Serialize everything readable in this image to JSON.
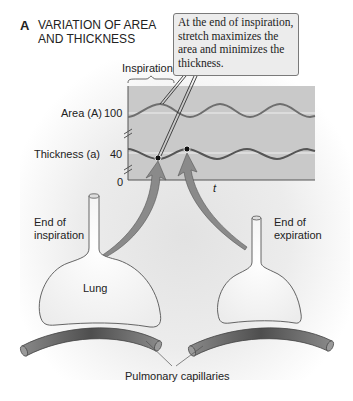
{
  "panel": {
    "letter": "A",
    "title": "VARIATION OF AREA AND THICKNESS"
  },
  "callout": {
    "text": "At the end of inspiration, stretch maximizes the area and minimizes the thickness."
  },
  "graph": {
    "bracket_label": "Inspiration",
    "y_axis": {
      "area_label": "Area (A)",
      "area_value": "100",
      "thickness_label": "Thickness (a)",
      "thickness_value": "40",
      "origin": "0"
    },
    "x_axis": {
      "label": "t"
    },
    "background_color": "#c9c9c9",
    "curve_color": "#6e6e6e"
  },
  "lungs": {
    "left": {
      "label": "End of inspiration",
      "label_line1": "End of",
      "label_line2": "inspiration",
      "inner_label": "Lung"
    },
    "right": {
      "label": "End of expiration",
      "label_line1": "End of",
      "label_line2": "expiration"
    }
  },
  "capillaries": {
    "label": "Pulmonary capillaries"
  },
  "colors": {
    "arrow": "#8a8a8a",
    "capillary": "#7a7a7a",
    "lung_fill": "#f2f2f2",
    "outline": "#555555"
  }
}
